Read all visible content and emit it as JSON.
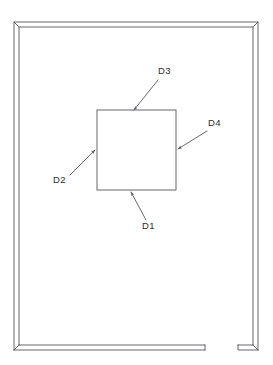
{
  "drawing": {
    "title": "frame-elevation-with-panel-dimensions",
    "line_color": "#55565a",
    "label_color": "#2b2b2b",
    "background": "#ffffff",
    "stroke_width": 0.9
  },
  "frame": {
    "name": "outer-frame",
    "outer": {
      "x": 14,
      "y": 22,
      "width": 244,
      "height": 328
    },
    "profile_offset": 5,
    "bottom_rail_gap": {
      "start_x": 205,
      "end_x": 238
    },
    "corners": [
      "top-left",
      "top-right",
      "bottom-left",
      "bottom-right"
    ]
  },
  "panel": {
    "name": "inner-panel",
    "x": 97,
    "y": 110,
    "width": 79,
    "height": 80
  },
  "dimensions": [
    {
      "id": "D1",
      "label": "D1",
      "edge": "bottom",
      "label_x": 142,
      "label_y": 229,
      "leader_start_x": 146,
      "leader_start_y": 220,
      "leader_end_x": 131,
      "leader_end_y": 192
    },
    {
      "id": "D2",
      "label": "D2",
      "edge": "left",
      "label_x": 53,
      "label_y": 183,
      "leader_start_x": 70,
      "leader_start_y": 175,
      "leader_end_x": 95,
      "leader_end_y": 150
    },
    {
      "id": "D3",
      "label": "D3",
      "edge": "top",
      "label_x": 158,
      "label_y": 74,
      "leader_start_x": 158,
      "leader_start_y": 80,
      "leader_end_x": 134,
      "leader_end_y": 110
    },
    {
      "id": "D4",
      "label": "D4",
      "edge": "right",
      "label_x": 208,
      "label_y": 126,
      "leader_start_x": 207,
      "leader_start_y": 131,
      "leader_end_x": 178,
      "leader_end_y": 149
    }
  ]
}
